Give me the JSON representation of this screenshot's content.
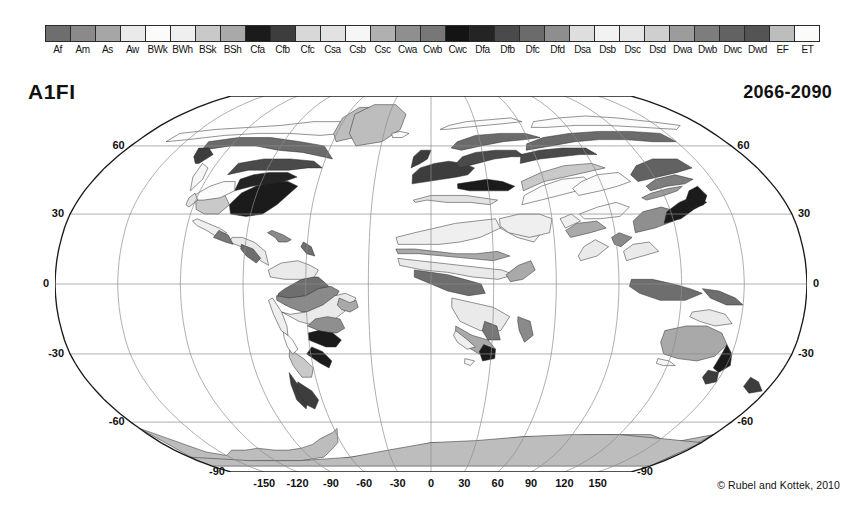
{
  "figure": {
    "scenario": "A1FI",
    "period": "2066-2090",
    "credit": "© Rubel and Kottek, 2010"
  },
  "legend": {
    "classes": [
      {
        "code": "Af",
        "gray": "#6e6e6e"
      },
      {
        "code": "Am",
        "gray": "#8a8a8a"
      },
      {
        "code": "As",
        "gray": "#a6a6a6"
      },
      {
        "code": "Aw",
        "gray": "#eaeaea"
      },
      {
        "code": "BWk",
        "gray": "#fbfbfb"
      },
      {
        "code": "BWh",
        "gray": "#efefef"
      },
      {
        "code": "BSk",
        "gray": "#c9c9c9"
      },
      {
        "code": "BSh",
        "gray": "#a9a9a9"
      },
      {
        "code": "Cfa",
        "gray": "#1b1b1b"
      },
      {
        "code": "Cfb",
        "gray": "#3d3d3d"
      },
      {
        "code": "Cfc",
        "gray": "#d8d8d8"
      },
      {
        "code": "Csa",
        "gray": "#e2e2e2"
      },
      {
        "code": "Csb",
        "gray": "#f6f6f6"
      },
      {
        "code": "Csc",
        "gray": "#b0b0b0"
      },
      {
        "code": "Cwa",
        "gray": "#8f8f8f"
      },
      {
        "code": "Cwb",
        "gray": "#777777"
      },
      {
        "code": "Cwc",
        "gray": "#141414"
      },
      {
        "code": "Dfa",
        "gray": "#242424"
      },
      {
        "code": "Dfb",
        "gray": "#4a4a4a"
      },
      {
        "code": "Dfc",
        "gray": "#6b6b6b"
      },
      {
        "code": "Dfd",
        "gray": "#8e8e8e"
      },
      {
        "code": "Dsa",
        "gray": "#dedede"
      },
      {
        "code": "Dsb",
        "gray": "#f2f2f2"
      },
      {
        "code": "Dsc",
        "gray": "#e6e6e6"
      },
      {
        "code": "Dsd",
        "gray": "#cfcfcf"
      },
      {
        "code": "Dwa",
        "gray": "#9c9c9c"
      },
      {
        "code": "Dwb",
        "gray": "#7d7d7d"
      },
      {
        "code": "Dwc",
        "gray": "#626262"
      },
      {
        "code": "Dwd",
        "gray": "#545454"
      },
      {
        "code": "EF",
        "gray": "#bdbdbd"
      },
      {
        "code": "ET",
        "gray": "#fbfbfb"
      }
    ]
  },
  "chart_data": {
    "type": "map",
    "title": "A1FI",
    "subtitle": "2066-2090",
    "projection": "robinson",
    "grid": true,
    "xlabel": "",
    "ylabel": "",
    "xlim": [
      -180,
      180
    ],
    "ylim": [
      -90,
      90
    ],
    "lat_ticks": [
      60,
      30,
      0,
      -30,
      -60,
      -90
    ],
    "lat_tick_labels": [
      "60",
      "30",
      "0",
      "-30",
      "-60",
      "-90"
    ],
    "lon_ticks": [
      -150,
      -120,
      -90,
      -60,
      -30,
      0,
      30,
      60,
      90,
      120,
      150
    ],
    "lon_tick_labels": [
      "-150",
      "-120",
      "-90",
      "-60",
      "-30",
      "0",
      "30",
      "60",
      "90",
      "120",
      "150"
    ],
    "graticule_lat_lines": [
      60,
      30,
      0,
      -30,
      -60
    ],
    "graticule_lon_lines": [
      -150,
      -120,
      -90,
      -60,
      -30,
      0,
      30,
      60,
      90,
      120,
      150
    ],
    "categories": [
      "Af",
      "Am",
      "As",
      "Aw",
      "BWk",
      "BWh",
      "BSk",
      "BSh",
      "Cfa",
      "Cfb",
      "Cfc",
      "Csa",
      "Csb",
      "Csc",
      "Cwa",
      "Cwb",
      "Cwc",
      "Dfa",
      "Dfb",
      "Dfc",
      "Dfd",
      "Dsa",
      "Dsb",
      "Dsc",
      "Dsd",
      "Dwa",
      "Dwb",
      "Dwc",
      "Dwd",
      "EF",
      "ET"
    ],
    "legend_position": "top",
    "annotations": [
      "A1FI",
      "2066-2090",
      "© Rubel and Kottek, 2010"
    ]
  }
}
